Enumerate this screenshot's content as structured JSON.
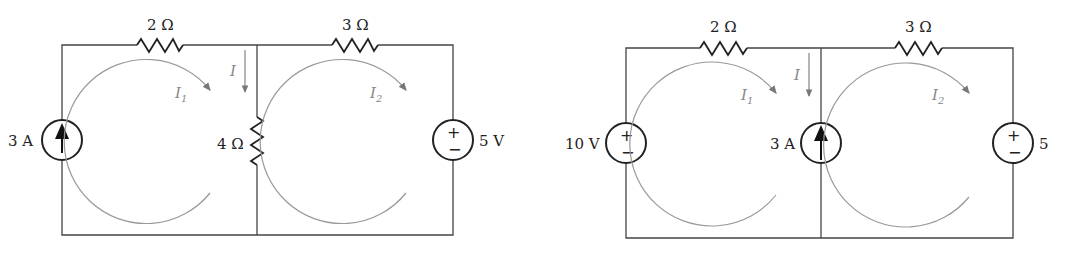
{
  "circuits": [
    {
      "id": "left",
      "resistor_top_left": "2 Ω",
      "resistor_top_right": "3 Ω",
      "left_source": {
        "type": "current",
        "label": "3 A",
        "direction": "up"
      },
      "middle_element": {
        "type": "resistor",
        "label": "4 Ω"
      },
      "right_source": {
        "type": "voltage",
        "label": "5 V",
        "plus": "+",
        "minus": "−"
      },
      "branch_current": "I",
      "mesh_currents": [
        {
          "label": "I",
          "sub": "1"
        },
        {
          "label": "I",
          "sub": "2"
        }
      ]
    },
    {
      "id": "right",
      "resistor_top_left": "2 Ω",
      "resistor_top_right": "3 Ω",
      "left_source": {
        "type": "voltage",
        "label": "10 V",
        "plus": "+",
        "minus": "−"
      },
      "middle_element": {
        "type": "current",
        "label": "3 A",
        "direction": "up"
      },
      "right_source": {
        "type": "voltage",
        "label": "5",
        "plus": "+",
        "minus": "−"
      },
      "branch_current": "I",
      "mesh_currents": [
        {
          "label": "I",
          "sub": "1"
        },
        {
          "label": "I",
          "sub": "2"
        }
      ]
    }
  ],
  "colors": {
    "wire": "#444444",
    "loop": "#999999",
    "text": "#222222"
  }
}
